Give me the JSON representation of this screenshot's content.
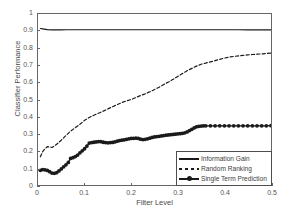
{
  "chart_data": {
    "type": "line",
    "title": "",
    "xlabel": "Filter Level",
    "ylabel": "Classifier Performance",
    "xlim": [
      0,
      0.5
    ],
    "ylim": [
      0,
      1
    ],
    "xticks": [
      "0",
      "0.1",
      "0.2",
      "0.3",
      "0.4",
      "0.5"
    ],
    "xtick_values": [
      0,
      0.1,
      0.2,
      0.3,
      0.4,
      0.5
    ],
    "yticks": [
      "0",
      "0.1",
      "0.2",
      "0.3",
      "0.4",
      "0.5",
      "0.6",
      "0.7",
      "0.8",
      "0.9",
      "1"
    ],
    "ytick_values": [
      0,
      0.1,
      0.2,
      0.3,
      0.4,
      0.5,
      0.6,
      0.7,
      0.8,
      0.9,
      1
    ],
    "grid": false,
    "legend_position": "lower right",
    "line_color": "#1a1a1a",
    "frame_color": "#666666",
    "series": [
      {
        "name": "Information Gain",
        "style": "solid",
        "marker": "none",
        "x": [
          0.005,
          0.01,
          0.02,
          0.03,
          0.04,
          0.05,
          0.06,
          0.08,
          0.1,
          0.12,
          0.15,
          0.18,
          0.2,
          0.22,
          0.25,
          0.28,
          0.3,
          0.33,
          0.35,
          0.38,
          0.4,
          0.43,
          0.45,
          0.48,
          0.5
        ],
        "values": [
          0.915,
          0.913,
          0.909,
          0.907,
          0.907,
          0.907,
          0.908,
          0.908,
          0.908,
          0.908,
          0.908,
          0.908,
          0.908,
          0.908,
          0.908,
          0.908,
          0.908,
          0.908,
          0.908,
          0.908,
          0.908,
          0.908,
          0.907,
          0.907,
          0.907
        ]
      },
      {
        "name": "Random Ranking",
        "style": "dashed",
        "marker": "none",
        "x": [
          0.005,
          0.01,
          0.015,
          0.02,
          0.025,
          0.03,
          0.035,
          0.04,
          0.045,
          0.05,
          0.06,
          0.07,
          0.08,
          0.09,
          0.1,
          0.11,
          0.12,
          0.13,
          0.14,
          0.15,
          0.16,
          0.17,
          0.18,
          0.19,
          0.2,
          0.21,
          0.22,
          0.23,
          0.24,
          0.25,
          0.26,
          0.27,
          0.28,
          0.29,
          0.3,
          0.31,
          0.32,
          0.33,
          0.34,
          0.35,
          0.36,
          0.37,
          0.38,
          0.39,
          0.4,
          0.41,
          0.42,
          0.43,
          0.44,
          0.45,
          0.46,
          0.47,
          0.48,
          0.49,
          0.5
        ],
        "values": [
          0.165,
          0.195,
          0.212,
          0.224,
          0.223,
          0.219,
          0.228,
          0.238,
          0.25,
          0.262,
          0.29,
          0.315,
          0.335,
          0.355,
          0.378,
          0.395,
          0.408,
          0.42,
          0.432,
          0.445,
          0.458,
          0.47,
          0.482,
          0.492,
          0.5,
          0.512,
          0.523,
          0.533,
          0.545,
          0.558,
          0.572,
          0.588,
          0.602,
          0.618,
          0.635,
          0.652,
          0.668,
          0.682,
          0.695,
          0.706,
          0.713,
          0.72,
          0.727,
          0.735,
          0.742,
          0.748,
          0.752,
          0.755,
          0.758,
          0.761,
          0.763,
          0.765,
          0.767,
          0.769,
          0.771
        ]
      },
      {
        "name": "Single Term Prediction",
        "style": "solid",
        "marker": "circle",
        "x": [
          0.005,
          0.01,
          0.015,
          0.02,
          0.025,
          0.03,
          0.035,
          0.04,
          0.045,
          0.05,
          0.055,
          0.06,
          0.065,
          0.07,
          0.075,
          0.08,
          0.085,
          0.09,
          0.095,
          0.1,
          0.105,
          0.11,
          0.115,
          0.12,
          0.125,
          0.13,
          0.135,
          0.14,
          0.145,
          0.15,
          0.155,
          0.16,
          0.165,
          0.17,
          0.175,
          0.18,
          0.185,
          0.19,
          0.195,
          0.2,
          0.205,
          0.21,
          0.215,
          0.22,
          0.225,
          0.23,
          0.235,
          0.24,
          0.245,
          0.25,
          0.255,
          0.26,
          0.265,
          0.27,
          0.275,
          0.28,
          0.285,
          0.29,
          0.295,
          0.3,
          0.305,
          0.31,
          0.315,
          0.32,
          0.325,
          0.33,
          0.335,
          0.34,
          0.345,
          0.35,
          0.355,
          0.36,
          0.37,
          0.38,
          0.39,
          0.4,
          0.41,
          0.42,
          0.43,
          0.44,
          0.45,
          0.46,
          0.47,
          0.48,
          0.49,
          0.5
        ],
        "values": [
          0.086,
          0.09,
          0.089,
          0.085,
          0.078,
          0.07,
          0.068,
          0.072,
          0.082,
          0.094,
          0.106,
          0.118,
          0.132,
          0.155,
          0.16,
          0.166,
          0.175,
          0.188,
          0.2,
          0.212,
          0.228,
          0.245,
          0.248,
          0.25,
          0.252,
          0.254,
          0.253,
          0.25,
          0.248,
          0.247,
          0.248,
          0.249,
          0.252,
          0.256,
          0.26,
          0.262,
          0.264,
          0.267,
          0.27,
          0.272,
          0.273,
          0.274,
          0.272,
          0.268,
          0.266,
          0.267,
          0.27,
          0.274,
          0.278,
          0.281,
          0.283,
          0.285,
          0.287,
          0.289,
          0.291,
          0.293,
          0.294,
          0.296,
          0.297,
          0.299,
          0.3,
          0.302,
          0.305,
          0.31,
          0.318,
          0.326,
          0.334,
          0.34,
          0.343,
          0.345,
          0.346,
          0.346,
          0.346,
          0.346,
          0.346,
          0.346,
          0.346,
          0.346,
          0.346,
          0.346,
          0.346,
          0.346,
          0.346,
          0.346,
          0.346,
          0.347
        ]
      }
    ]
  },
  "legend": {
    "items": [
      {
        "label": "Information Gain"
      },
      {
        "label": "Random Ranking"
      },
      {
        "label": "Single Term Prediction"
      }
    ]
  }
}
